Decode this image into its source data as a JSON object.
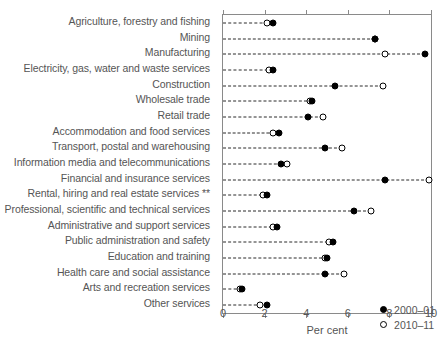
{
  "chart_data": {
    "type": "scatter",
    "title": "",
    "xlabel": "Per cent",
    "ylabel": "",
    "xlim": [
      0,
      10
    ],
    "xticks": [
      0,
      2,
      4,
      6,
      8,
      10
    ],
    "xtick_labels": [
      "0",
      "2",
      "4",
      "6",
      "8",
      "10"
    ],
    "grid": false,
    "legend_position": "bottom-right",
    "orientation": "horizontal-dot-plot",
    "categories": [
      "Agriculture, forestry and fishing",
      "Mining",
      "Manufacturing",
      "Electricity, gas, water and waste services",
      "Construction",
      "Wholesale trade",
      "Retail trade",
      "Accommodation and food services",
      "Transport, postal and warehousing",
      "Information media and telecommunications",
      "Financial and insurance services",
      "Rental, hiring and real estate services **",
      "Professional, scientific and technical services",
      "Administrative and support services",
      "Public administration and safety",
      "Education and training",
      "Health care and social assistance",
      "Arts and recreation services",
      "Other services"
    ],
    "series": [
      {
        "name": "2000-01",
        "marker": "filled-circle",
        "color": "#000000",
        "values": [
          2.4,
          7.3,
          9.7,
          2.4,
          5.4,
          4.3,
          4.1,
          2.7,
          4.9,
          2.8,
          7.8,
          2.1,
          6.3,
          2.6,
          5.3,
          5.0,
          4.9,
          0.9,
          2.1
        ]
      },
      {
        "name": "2010-11",
        "marker": "open-circle",
        "color": "#000000",
        "values": [
          2.1,
          7.3,
          7.8,
          2.2,
          7.7,
          4.2,
          4.8,
          2.4,
          5.7,
          3.1,
          9.9,
          1.9,
          7.1,
          2.4,
          5.1,
          4.9,
          5.8,
          0.8,
          1.8
        ]
      }
    ]
  },
  "legend": {
    "items": [
      {
        "label": "2000–01",
        "marker": "filled-circle"
      },
      {
        "label": "2010–11",
        "marker": "open-circle"
      }
    ]
  }
}
